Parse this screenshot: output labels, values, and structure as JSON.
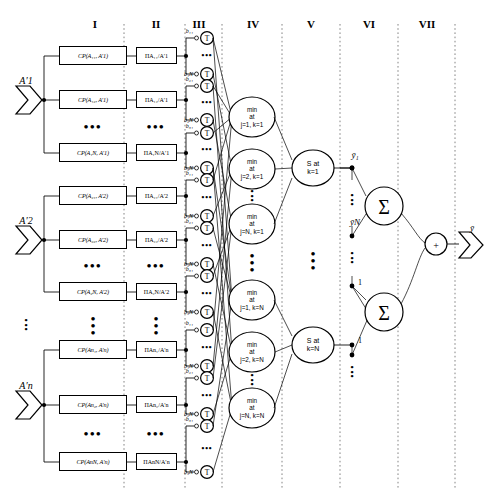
{
  "diagram": {
    "layers": [
      {
        "id": "I",
        "label": "I",
        "x": 95
      },
      {
        "id": "II",
        "label": "II",
        "x": 156
      },
      {
        "id": "III",
        "label": "III",
        "x": 196
      },
      {
        "id": "IV",
        "label": "IV",
        "x": 253
      },
      {
        "id": "V",
        "label": "V",
        "x": 311
      },
      {
        "id": "VI",
        "label": "VI",
        "x": 369
      },
      {
        "id": "VII",
        "label": "VII",
        "x": 427
      }
    ],
    "inputs": [
      {
        "label": "A′1",
        "sub": "1",
        "y": 100
      },
      {
        "label": "A′2",
        "sub": "2",
        "y": 240
      },
      {
        "label": "A′n",
        "sub": "n",
        "y": 405
      }
    ],
    "input_ellipsis": "•\n•\n•",
    "cp_boxes": [
      {
        "text": "CP(A₁₁, A′1)",
        "y": 56
      },
      {
        "text": "CP(A₁₂, A′1)",
        "y": 100
      },
      {
        "text": "CP(A₁N, A′1)",
        "y": 153
      },
      {
        "text": "CP(A₂₁, A′2)",
        "y": 196
      },
      {
        "text": "CP(A₂₂, A′2)",
        "y": 240
      },
      {
        "text": "CP(A₂N, A′2)",
        "y": 292
      },
      {
        "text": "CP(An₁, A′n)",
        "y": 350
      },
      {
        "text": "CP(An₂, A′n)",
        "y": 405
      },
      {
        "text": "CP(AnN, A′n)",
        "y": 462
      }
    ],
    "pi_boxes": [
      {
        "text": "ΠA₁₁/A′1",
        "y": 56
      },
      {
        "text": "ΠA₁₂/A′1",
        "y": 100
      },
      {
        "text": "ΠA₁N/A′1",
        "y": 153
      },
      {
        "text": "ΠA₂₁/A′2",
        "y": 196
      },
      {
        "text": "ΠA₂₂/A′2",
        "y": 240
      },
      {
        "text": "ΠA₂N/A′2",
        "y": 292
      },
      {
        "text": "ΠAn₁/A′n",
        "y": 350
      },
      {
        "text": "ΠAn₂/A′n",
        "y": 405
      },
      {
        "text": "ΠAnN/A′n",
        "y": 462
      }
    ],
    "b_labels": [
      {
        "text": "b₁₁",
        "y": 38
      },
      {
        "text": "b₁N",
        "y": 74
      },
      {
        "text": "b₂₁",
        "y": 86
      },
      {
        "text": "b₂N",
        "y": 120
      },
      {
        "text": "b₃₁",
        "y": 133
      },
      {
        "text": "b₃N",
        "y": 168
      },
      {
        "text": "b₁₁",
        "y": 180
      },
      {
        "text": "b₁N",
        "y": 216
      },
      {
        "text": "b₂₁",
        "y": 228
      },
      {
        "text": "b₂N",
        "y": 264
      },
      {
        "text": "b₃₁",
        "y": 276
      },
      {
        "text": "b₃N",
        "y": 312
      },
      {
        "text": "b₁₁",
        "y": 330
      },
      {
        "text": "b₁N",
        "y": 366
      },
      {
        "text": "b₂₁",
        "y": 378
      },
      {
        "text": "b₂N",
        "y": 414
      },
      {
        "text": "b₃₁",
        "y": 426
      },
      {
        "text": "b₃N",
        "y": 472
      }
    ],
    "t_node_label": "T",
    "min_nodes": [
      {
        "text": "min\nat\nj=1, k=1",
        "y": 117
      },
      {
        "text": "min\nat\nj=2, k=1",
        "y": 169
      },
      {
        "text": "min\nat\nj=N, k=1",
        "y": 224
      },
      {
        "text": "min\nat\nj=1, k=N",
        "y": 300
      },
      {
        "text": "min\nat\nj=2, k=N",
        "y": 352
      },
      {
        "text": "min\nat\nj=N, k=N",
        "y": 408
      }
    ],
    "min_ellipsis": "•\n•\n•",
    "s_nodes": [
      {
        "text": "S at\nk=1",
        "y": 168
      },
      {
        "text": "S at\nk=N",
        "y": 345
      }
    ],
    "s_ellipsis": "•\n•\n•",
    "y_labels": [
      {
        "text": "ȳ₁",
        "y": 154
      },
      {
        "text": "ȳN",
        "y": 222
      }
    ],
    "weight_labels": [
      {
        "text": "1",
        "y": 281
      },
      {
        "text": "1",
        "y": 340
      }
    ],
    "sum_nodes": [
      {
        "symbol": "Σ",
        "y": 206
      },
      {
        "symbol": "Σ",
        "y": 312
      }
    ],
    "divider_node": {
      "symbol": "+",
      "y": 244
    },
    "output": {
      "label": "ȳ",
      "y": 228
    }
  }
}
